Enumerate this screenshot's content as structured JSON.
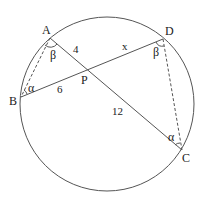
{
  "diagram": {
    "colors": {
      "stroke": "#555555",
      "text": "#222222",
      "background": "#ffffff"
    },
    "circle": {
      "cx": 107,
      "cy": 104,
      "r": 87
    },
    "points": {
      "A": {
        "label": "A",
        "x": 50,
        "y": 38
      },
      "B": {
        "label": "B",
        "x": 21,
        "y": 97
      },
      "C": {
        "label": "C",
        "x": 182,
        "y": 150
      },
      "D": {
        "label": "D",
        "x": 163,
        "y": 39
      },
      "P": {
        "label": "P",
        "x": 87,
        "y": 72
      }
    },
    "segments": {
      "AP": "4",
      "PD": "x",
      "BP": "6",
      "PC": "12"
    },
    "angles": {
      "at_A": "β",
      "at_D": "β",
      "at_B": "α",
      "at_C": "α"
    }
  }
}
